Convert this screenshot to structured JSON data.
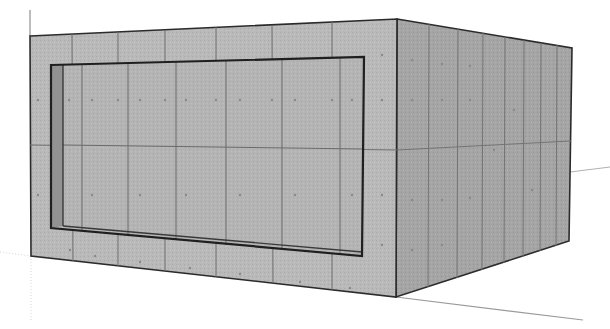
{
  "scene": {
    "title": "Concrete box with recessed front panel",
    "description": "3D perspective model of a rectangular concrete block with a recessed rectangular opening on the front face, tiled with formwork panel seams and tie-hole dots",
    "colors": {
      "background": "#ffffff",
      "front_face": "#b9b9b9",
      "right_face": "#a4a4a4",
      "recess_face": "#b3b3b3",
      "reveal": "#8f8f8f",
      "edge": "#2b2b2b",
      "seam": "#6e6e6e",
      "tie_hole": "#8a8a8a",
      "axis_line": "#9a9a9a"
    }
  }
}
